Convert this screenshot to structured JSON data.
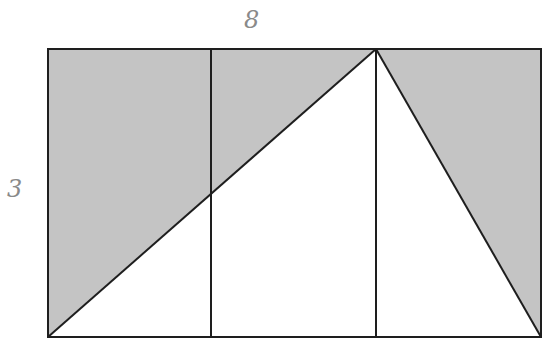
{
  "diagram": {
    "labels": {
      "top": "8",
      "left": "3"
    },
    "colors": {
      "shade": "#c4c4c4",
      "stroke": "#1e1e1e",
      "label": "#8a8a8a",
      "background": "#ffffff"
    },
    "rectangle": {
      "width": 8,
      "height": 3
    }
  }
}
